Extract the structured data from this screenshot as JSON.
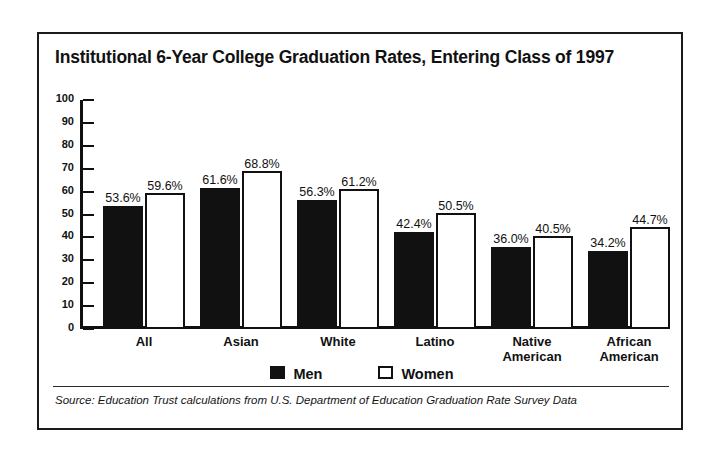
{
  "figure": {
    "title": "Institutional 6-Year College Graduation Rates, Entering Class of 1997",
    "source_note": "Source: Education Trust calculations from U.S. Department of Education Graduation Rate Survey Data",
    "border_color": "#1a1a1a",
    "background": "#ffffff"
  },
  "legend": {
    "position": "bottom-center",
    "items": [
      {
        "label": "Men",
        "swatch": "filled-square-icon",
        "color": "#111111"
      },
      {
        "label": "Women",
        "swatch": "outlined-square-icon",
        "color": "#ffffff"
      }
    ]
  },
  "axis": {
    "y_ticks": [
      "100",
      "90",
      "80",
      "70",
      "60",
      "50",
      "40",
      "30",
      "20",
      "10",
      "0"
    ]
  },
  "chart_data": {
    "type": "bar",
    "title": "Institutional 6-Year College Graduation Rates, Entering Class of 1997",
    "xlabel": "",
    "ylabel": "",
    "ylim": [
      0,
      100
    ],
    "ytick_step": 10,
    "grid": false,
    "legend_position": "bottom-center",
    "categories": [
      "All",
      "Asian",
      "White",
      "Latino",
      "Native American",
      "African American"
    ],
    "category_lines": [
      [
        "All"
      ],
      [
        "Asian"
      ],
      [
        "White"
      ],
      [
        "Latino"
      ],
      [
        "Native",
        "American"
      ],
      [
        "African",
        "American"
      ]
    ],
    "series": [
      {
        "name": "Men",
        "color": "#111111",
        "values": [
          53.6,
          61.6,
          56.3,
          42.4,
          36.0,
          34.2
        ],
        "labels": [
          "53.6%",
          "61.6%",
          "56.3%",
          "42.4%",
          "36.0%",
          "34.2%"
        ]
      },
      {
        "name": "Women",
        "color": "#ffffff",
        "values": [
          59.6,
          68.8,
          61.2,
          50.5,
          40.5,
          44.7
        ],
        "labels": [
          "59.6%",
          "68.8%",
          "61.2%",
          "50.5%",
          "40.5%",
          "44.7%"
        ]
      }
    ],
    "source": "Education Trust calculations from U.S. Department of Education Graduation Rate Survey Data"
  }
}
